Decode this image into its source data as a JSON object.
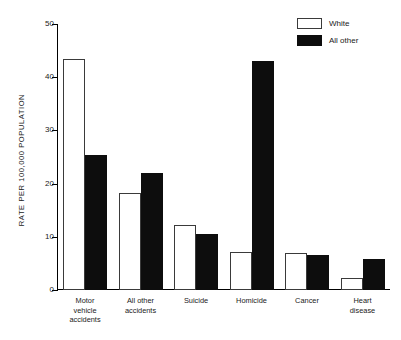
{
  "chart_data": {
    "type": "bar",
    "title": "",
    "subtitle": "",
    "xlabel": "",
    "ylabel": "RATE PER 100,000 POPULATION",
    "ylim": [
      0,
      50
    ],
    "yticks": [
      0,
      10,
      20,
      30,
      40,
      50
    ],
    "ytick_labels": [
      "0",
      "10",
      "20",
      "30",
      "40",
      "50"
    ],
    "grid": false,
    "legend_position": "top-right",
    "categories": [
      "Motor vehicle accidents",
      "All other accidents",
      "Suicide",
      "Homicide",
      "Cancer",
      "Heart disease"
    ],
    "category_label_lines": [
      [
        "Motor",
        "vehicle",
        "accidents"
      ],
      [
        "All other",
        "accidents"
      ],
      [
        "Suicide"
      ],
      [
        "Homicide"
      ],
      [
        "Cancer"
      ],
      [
        "Heart",
        "disease"
      ]
    ],
    "series": [
      {
        "name": "White",
        "color": "#ffffff",
        "edge_color": "#3a3a3a",
        "values": [
          43.5,
          18.3,
          12.2,
          7.2,
          7.0,
          2.2
        ]
      },
      {
        "name": "All other",
        "color": "#0d0d0d",
        "edge_color": "#0d0d0d",
        "values": [
          25.3,
          22.0,
          10.6,
          43.0,
          6.5,
          5.8
        ]
      }
    ]
  },
  "legend": {
    "items": [
      {
        "label": "White",
        "swatch": "white"
      },
      {
        "label": "All other",
        "swatch": "black"
      }
    ]
  }
}
